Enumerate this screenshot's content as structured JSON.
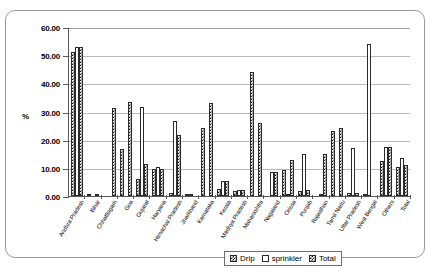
{
  "chart_data": {
    "type": "bar",
    "title": "",
    "subtitle": "",
    "xlabel": "",
    "ylabel": "%",
    "ylim": [
      0,
      60
    ],
    "ytick_labels": [
      "0.00",
      "10.00",
      "20.00",
      "30.00",
      "40.00",
      "50.00",
      "60.00"
    ],
    "ytick_values": [
      0,
      10,
      20,
      30,
      40,
      50,
      60
    ],
    "grid": true,
    "legend_position": "bottom-right",
    "categories": [
      "Andhra Pradesh",
      "Bihar",
      "Chhattisgarh",
      "Goa",
      "Gujarat",
      "Haryana",
      "Himachal Pradesh",
      "Jharkhand",
      "Karnataka",
      "Kerala",
      "Madhya Pradesh",
      "Maharashtra",
      "Nagaland",
      "Orissa",
      "Punjab",
      "Rajasthan",
      "Tamil Nadu",
      "Uttar Pradesh",
      "West Bengal",
      "Others",
      "Total"
    ],
    "series": [
      {
        "name": "Drip",
        "values": [
          51.0,
          0.4,
          0.0,
          16.8,
          5.9,
          9.5,
          1.2,
          0.3,
          24.0,
          2.4,
          1.9,
          44.0,
          0.0,
          9.4,
          1.8,
          0.0,
          23.0,
          1.0,
          0.5,
          12.5,
          10.2
        ]
      },
      {
        "name": "sprinkler",
        "values": [
          53.0,
          0.0,
          0.0,
          0.0,
          31.5,
          10.2,
          26.5,
          0.5,
          0.0,
          5.2,
          2.2,
          0.0,
          8.5,
          0.4,
          14.8,
          0.4,
          0.0,
          17.0,
          54.0,
          17.5,
          13.5
        ]
      },
      {
        "name": "Total",
        "values": [
          53.0,
          0.4,
          31.3,
          33.5,
          11.5,
          9.5,
          21.8,
          0.0,
          33.0,
          5.2,
          2.2,
          26.0,
          8.5,
          12.8,
          2.0,
          14.8,
          24.2,
          1.0,
          0.0,
          17.5,
          11.0
        ]
      }
    ],
    "legend": [
      {
        "label": "Drip",
        "pattern": "checkered"
      },
      {
        "label": "sprinkler",
        "pattern": "hollow"
      },
      {
        "label": "Total",
        "pattern": "checkered"
      }
    ]
  },
  "colors": {
    "bar_outline": "#2b2b2b",
    "gridline": "#b9b9b9",
    "axis": "#5a5a5a",
    "frame": "#9a9a9a",
    "background": "#ffffff"
  }
}
